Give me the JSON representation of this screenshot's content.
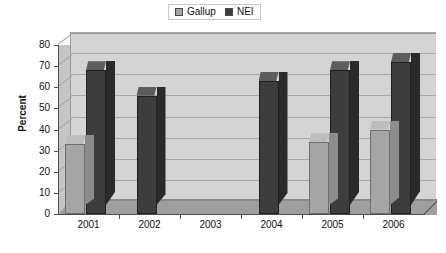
{
  "chart_data": {
    "type": "bar",
    "title": "",
    "subtitle": "",
    "xlabel": "",
    "ylabel": "Percent",
    "categories": [
      "2001",
      "2002",
      "2003",
      "2004",
      "2005",
      "2006"
    ],
    "series": [
      {
        "name": "Gallup",
        "color": "#a5a5a5",
        "values": [
          33,
          null,
          null,
          null,
          34,
          40
        ]
      },
      {
        "name": "NEI",
        "color": "#3d3d3d",
        "values": [
          68,
          56,
          null,
          63,
          68,
          72
        ]
      }
    ],
    "ylim": [
      0,
      80
    ],
    "ytick_step": 10,
    "yticks": [
      "0",
      "10",
      "20",
      "30",
      "40",
      "50",
      "60",
      "70",
      "80"
    ],
    "grid": true,
    "grid_axis": "y",
    "legend_position": "top-center",
    "three_d": true,
    "plot_background": "#d4d4d4",
    "figure_background": "#ffffff"
  },
  "legend": {
    "items": [
      {
        "label": "Gallup",
        "swatch_icon": "square-swatch-icon",
        "color": "#a5a5a5"
      },
      {
        "label": "NEI",
        "swatch_icon": "square-swatch-icon",
        "color": "#3d3d3d"
      }
    ]
  }
}
